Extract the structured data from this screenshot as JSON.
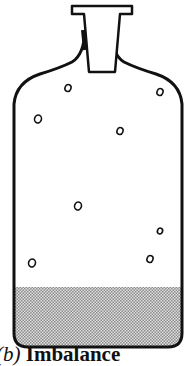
{
  "figure": {
    "caption_label": "(b)",
    "caption_text": "Imbalance",
    "visible_caption": "b) Imbalanc",
    "colors": {
      "outline": "#111111",
      "background": "#ffffff",
      "sediment": "#bdbdbd"
    },
    "bubbles": [
      {
        "x": 68,
        "y": 88,
        "r": 3.5
      },
      {
        "x": 160,
        "y": 92,
        "r": 3.5
      },
      {
        "x": 38,
        "y": 119,
        "r": 4
      },
      {
        "x": 120,
        "y": 131,
        "r": 3.5
      },
      {
        "x": 78,
        "y": 206,
        "r": 4
      },
      {
        "x": 160,
        "y": 231,
        "r": 3
      },
      {
        "x": 150,
        "y": 259,
        "r": 3.5
      },
      {
        "x": 32,
        "y": 263,
        "r": 4
      }
    ]
  }
}
